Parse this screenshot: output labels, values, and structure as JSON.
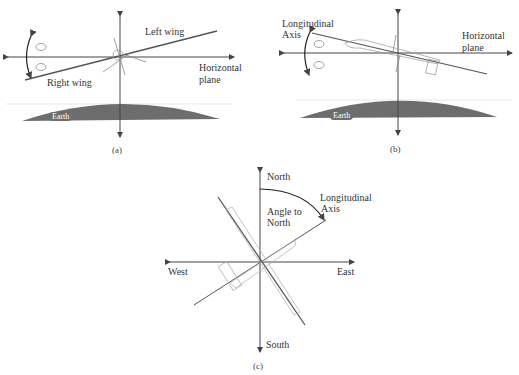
{
  "panel_a": {
    "caption": "(a)",
    "left_wing": "Left wing",
    "right_wing": "Right wing",
    "horizontal": "Horizontal",
    "plane": "plane",
    "earth": "Earth",
    "sign_top": "-",
    "sign_bottom": "+"
  },
  "panel_b": {
    "caption": "(b)",
    "longitudinal": "Longitudinal",
    "axis": "Axis",
    "horizontal": "Horizontal",
    "plane": "plane",
    "earth": "Earth",
    "sign_top": "+",
    "sign_bottom": "-"
  },
  "panel_c": {
    "caption": "(c)",
    "north": "North",
    "south": "South",
    "east": "East",
    "west": "West",
    "angle_line1": "Angle to",
    "angle_line2": "North",
    "longitudinal": "Longitudinal",
    "axis": "Axis"
  },
  "colors": {
    "line": "#444444",
    "earth": "#6d6d6d",
    "arc": "#222222"
  }
}
